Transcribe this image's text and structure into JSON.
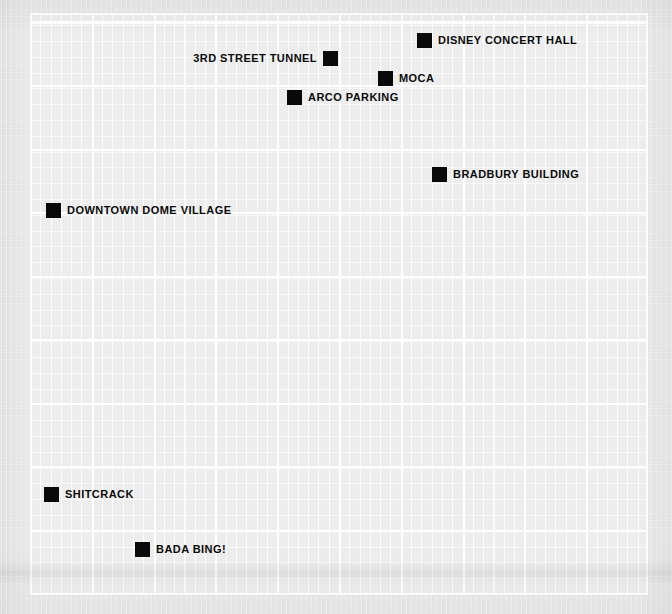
{
  "map": {
    "background_color": "#e9e9e9",
    "grid_plate_color": "#ededed",
    "grid_line_color": "#ffffff",
    "marker_color": "#090909",
    "label_color": "#0b0b0b",
    "grid": {
      "left": 30,
      "top": 13,
      "width": 618,
      "height": 582,
      "minor_spacing_x": 10.3,
      "minor_spacing_y": 15.8,
      "major_spacing_x": 61.8,
      "major_spacing_y": 63.5
    },
    "pois": [
      {
        "id": "disney-concert-hall",
        "label": "DISNEY CONCERT HALL",
        "marker_x": 417,
        "marker_y": 33,
        "label_side": "right"
      },
      {
        "id": "3rd-street-tunnel",
        "label": "3RD STREET TUNNEL",
        "marker_x": 323,
        "marker_y": 51,
        "label_side": "left"
      },
      {
        "id": "moca",
        "label": "MOCA",
        "marker_x": 378,
        "marker_y": 71,
        "label_side": "right"
      },
      {
        "id": "arco-parking",
        "label": "ARCO PARKING",
        "marker_x": 287,
        "marker_y": 90,
        "label_side": "right"
      },
      {
        "id": "bradbury-building",
        "label": "BRADBURY BUILDING",
        "marker_x": 432,
        "marker_y": 167,
        "label_side": "right"
      },
      {
        "id": "downtown-dome-village",
        "label": "DOWNTOWN DOME VILLAGE",
        "marker_x": 46,
        "marker_y": 203,
        "label_side": "right"
      },
      {
        "id": "shitcrack",
        "label": "SHITCRACK",
        "marker_x": 44,
        "marker_y": 487,
        "label_side": "right"
      },
      {
        "id": "bada-bing",
        "label": "BADA BING!",
        "marker_x": 135,
        "marker_y": 542,
        "label_side": "right"
      }
    ]
  }
}
